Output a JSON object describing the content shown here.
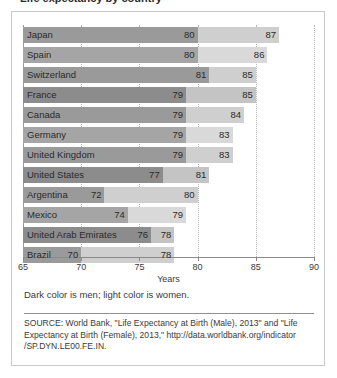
{
  "title": {
    "text": "Life expectancy by country"
  },
  "chart_data": {
    "type": "bar",
    "orientation": "horizontal",
    "title": "",
    "xlabel": "Years",
    "ylabel": "",
    "xlim": [
      65,
      90
    ],
    "xticks": [
      65,
      70,
      75,
      80,
      85,
      90
    ],
    "grid": true,
    "grid_axis": "x",
    "legend_position": "below-plot",
    "legend_note": "Dark color is men; light color is women.",
    "categories": [
      "Japan",
      "Spain",
      "Switzerland",
      "France",
      "Canada",
      "Germany",
      "United Kingdom",
      "United States",
      "Argentina",
      "Mexico",
      "United Arab Emirates",
      "Brazil"
    ],
    "series": [
      {
        "name": "Men",
        "color": "#9a9a9a",
        "values": [
          80,
          80,
          81,
          79,
          79,
          79,
          79,
          77,
          72,
          74,
          76,
          70
        ]
      },
      {
        "name": "Women",
        "color": "#cfcfcf",
        "values": [
          87,
          86,
          85,
          85,
          84,
          83,
          83,
          81,
          80,
          79,
          78,
          78
        ]
      }
    ],
    "source": "SOURCE: World Bank, \"Life Expectancy at Birth (Male), 2013\" and \"Life Expectancy at Birth (Female), 2013,\" http://data.worldbank.org/indicator /SP.DYN.LE00.FE.IN."
  },
  "colors": {
    "male_bar": "#9a9a9a",
    "female_bar": "#cfcfcf",
    "grid": "#b4b4b4",
    "axis": "#8a8a8a",
    "card_border": "#c9c9c9",
    "text": "#2a2a2a"
  }
}
